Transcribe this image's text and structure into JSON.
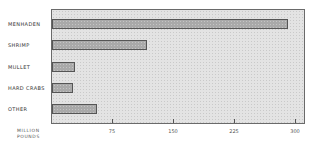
{
  "chart_data": {
    "type": "bar",
    "orientation": "horizontal",
    "title": "",
    "categories": [
      "MENHADEN",
      "SHRIMP",
      "MULLET",
      "HARD CRABS",
      "OTHER"
    ],
    "values": [
      290,
      117,
      28,
      26,
      55
    ],
    "xlabel": "MILLION POUNDS",
    "xlabel_lines": [
      "MILLION",
      "POUNDS"
    ],
    "ylabel": "",
    "xticks": [
      75,
      150,
      225,
      300
    ],
    "xlim": [
      0,
      312
    ],
    "grid": false,
    "legend": null
  },
  "colors": {
    "plot_background": "#e3e3e3",
    "bar_fill": "#a9a9a9",
    "bar_border": "#555555",
    "frame": "#6a6a6a"
  }
}
